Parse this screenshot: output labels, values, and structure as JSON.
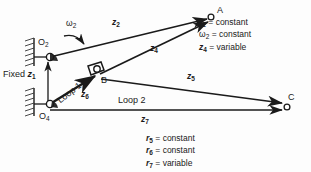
{
  "diagram": {
    "type": "kinematic-vector-loop-diagram",
    "points": [
      {
        "id": "A",
        "label": "A",
        "sub": "",
        "x": 214,
        "y": 16
      },
      {
        "id": "B",
        "label": "B",
        "sub": "",
        "x": 97,
        "y": 76
      },
      {
        "id": "C",
        "label": "C",
        "sub": "",
        "x": 287,
        "y": 104
      },
      {
        "id": "O2",
        "label": "O",
        "sub": "2",
        "x": 45,
        "y": 47
      },
      {
        "id": "O4",
        "label": "O",
        "sub": "4",
        "x": 45,
        "y": 113
      }
    ],
    "vectors": [
      {
        "id": "z2",
        "label": "z",
        "sub": "2",
        "from": "O2",
        "to": "A",
        "label_x": 118,
        "label_y": 22
      },
      {
        "id": "z4",
        "label": "z",
        "sub": "4",
        "from": "B",
        "to": "A",
        "label_x": 152,
        "label_y": 48
      },
      {
        "id": "z5",
        "label": "z",
        "sub": "5",
        "from": "B",
        "to": "C",
        "label_x": 190,
        "label_y": 77
      },
      {
        "id": "z6",
        "label": "z",
        "sub": "6",
        "from": "O4",
        "to": "B",
        "label_x": 84,
        "label_y": 93
      },
      {
        "id": "z7",
        "label": "z",
        "sub": "7",
        "from": "O4",
        "to": "C",
        "label_x": 145,
        "label_y": 122
      },
      {
        "id": "z1",
        "label": "z",
        "sub": "1",
        "from": "O4",
        "to": "O2",
        "label_x": 50,
        "label_y": 74
      }
    ],
    "angular_velocity": {
      "label": "ω",
      "sub": "2",
      "x": 70,
      "y": 22
    },
    "fixed_label": {
      "text": "Fixed ",
      "sym": "z",
      "sub": "1",
      "x": 4,
      "y": 74
    },
    "loops": [
      {
        "id": "loop1",
        "label": "Loop 1",
        "x": 59,
        "y": 66,
        "rotated": true
      },
      {
        "id": "loop2",
        "label": "Loop 2",
        "x": 121,
        "y": 100,
        "rotated": false
      }
    ],
    "notes": [
      {
        "id": "note-top",
        "x": 199,
        "y": 18,
        "rows": [
          {
            "sym": "r",
            "sub": "2",
            "rel": " = ",
            "val": "constant"
          },
          {
            "sym": "ω",
            "sub": "2",
            "rel": " = ",
            "val": "constant",
            "omega": true
          },
          {
            "sym": "z",
            "sub": "4",
            "rel": " = ",
            "val": "variable"
          }
        ]
      },
      {
        "id": "note-bottom",
        "x": 146,
        "y": 135,
        "rows": [
          {
            "sym": "r",
            "sub": "5",
            "rel": " = ",
            "val": "constant"
          },
          {
            "sym": "r",
            "sub": "6",
            "rel": " = ",
            "val": "constant"
          },
          {
            "sym": "r",
            "sub": "7",
            "rel": " = ",
            "val": "variable"
          }
        ]
      }
    ],
    "colors": {
      "line": "#1a1a1a",
      "ground_hatch": "#333333",
      "background": "#fdfdfd"
    }
  }
}
